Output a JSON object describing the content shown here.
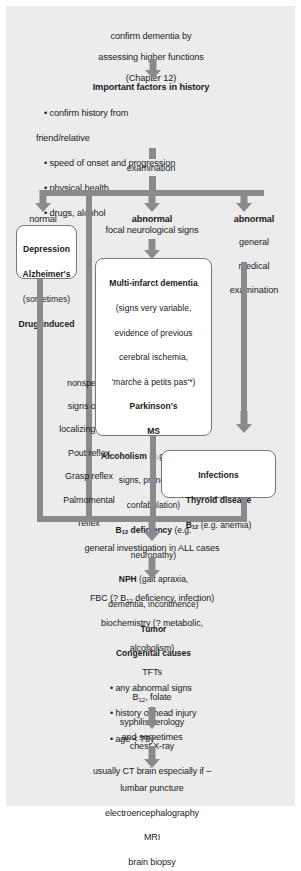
{
  "diagram": {
    "colors": {
      "page_background": "#ffffff",
      "panel_background": "#ececed",
      "connector": "#8a8a8c",
      "box_border": "#77787a",
      "box_fill": "#ffffff",
      "text": "#1b1b1b"
    },
    "nodes": {
      "start": {
        "line1": "confirm dementia by",
        "line2": "assessing higher functions",
        "line3": "(Chapter 12)"
      },
      "history": {
        "heading": "Important factors in history",
        "bullets": [
          "• confirm history  from",
          "friend/relative",
          "• speed of onset and progression",
          "• physical health",
          "• drugs, alcohol"
        ]
      },
      "examination": {
        "label": "examination"
      },
      "branch_normal": {
        "label": "normal",
        "items": [
          {
            "text": "Depression",
            "bold": true
          },
          {
            "text": "Alzheimer's",
            "bold": true
          },
          {
            "text": "(sometimes)",
            "bold": false
          },
          {
            "text": "Drug-induced",
            "bold": true
          }
        ]
      },
      "branch_nonspecific": {
        "lines": [
          "nonspecific",
          "signs of no",
          "localizing value",
          "Pout reflex",
          "Grasp reflex",
          "Palmomental",
          "reflex"
        ]
      },
      "branch_focal": {
        "label_bold": "abnormal",
        "label_sub": "focal neurological signs"
      },
      "branch_general": {
        "label_bold": "abnormal",
        "label_lines": [
          "general",
          "medical",
          "examination"
        ]
      },
      "focal_box": {
        "heading": "Multi-infarct dementia",
        "detail_lines": [
          "(signs very variable,",
          "evidence of previous",
          "cerebral ischemia,",
          "'marche à petits pas'*)"
        ],
        "entries": [
          {
            "bold": "Parkinson's",
            "rest": ""
          },
          {
            "bold": "MS",
            "rest": ""
          },
          {
            "bold": "Alcoholism",
            "rest": " (e.g. cerebellar"
          },
          {
            "bold": "",
            "rest": "signs, pronounced"
          },
          {
            "bold": "",
            "rest": "confabulation)"
          },
          {
            "bold": "B12 deficiency",
            "rest": " (e.g."
          },
          {
            "bold": "",
            "rest": "neuropathy)"
          },
          {
            "bold": "NPH",
            "rest": " (gait apraxia,"
          },
          {
            "bold": "",
            "rest": "dementia, incontinence)"
          },
          {
            "bold": "Tumor",
            "rest": ""
          },
          {
            "bold": "Congenital causes",
            "rest": ""
          }
        ]
      },
      "general_box": {
        "line1": "Infections",
        "line2": "Thyroid disease",
        "line3_bold": "B12",
        "line3_rest": " (e.g. anemia)"
      },
      "general_investigation": {
        "label": "general investigation in ALL cases"
      },
      "investigations": {
        "lines": [
          "FBC (? B12 deficiency, infection)",
          "biochemistry (? metabolic,",
          "alcoholism)",
          "TFTs",
          "B12, folate",
          "syphilis serology",
          "chest X-ray",
          "usually CT brain especially if –"
        ],
        "bullets": [
          "• any abnormal signs",
          "• history of head injury",
          "• age < 75y"
        ]
      },
      "and_sometimes": {
        "label": "and sometimes"
      },
      "further_tests": {
        "lines": [
          "lumbar puncture",
          "electroencephalography",
          "MRI",
          "brain biopsy"
        ]
      }
    }
  }
}
